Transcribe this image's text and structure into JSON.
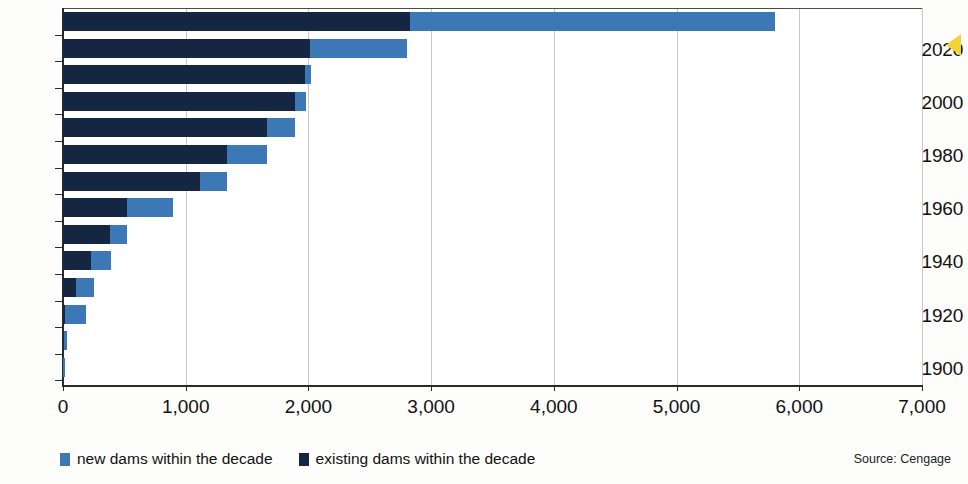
{
  "chart_data": {
    "type": "bar",
    "orientation": "horizontal",
    "stacked": true,
    "title": "",
    "xlabel": "",
    "ylabel": "",
    "xlim": [
      0,
      7000
    ],
    "xticks": [
      0,
      1000,
      2000,
      3000,
      4000,
      5000,
      6000,
      7000
    ],
    "xtick_labels": [
      "0",
      "1,000",
      "2,000",
      "3,000",
      "4,000",
      "5,000",
      "6,000",
      "7,000"
    ],
    "grid": true,
    "grid_axis": "x",
    "categories": [
      1900,
      1910,
      1920,
      1930,
      1940,
      1950,
      1960,
      1970,
      1980,
      1990,
      2000,
      2010,
      2020,
      2030
    ],
    "ytick_labels": [
      "1900",
      "1920",
      "1940",
      "1960",
      "1980",
      "2000",
      "2020"
    ],
    "ytick_values": [
      1900,
      1920,
      1940,
      1960,
      1980,
      2000,
      2020
    ],
    "legend_position": "bottom-left",
    "series": [
      {
        "name": "existing dams within the decade",
        "color": "#152642",
        "values": [
          0,
          10,
          20,
          110,
          230,
          380,
          520,
          1120,
          1340,
          1660,
          1890,
          1970,
          2010,
          2830
        ]
      },
      {
        "name": "new dams within the decade",
        "color": "#3b78b5",
        "values": [
          15,
          20,
          165,
          140,
          160,
          145,
          380,
          215,
          320,
          230,
          90,
          55,
          790,
          2970
        ]
      }
    ],
    "totals": [
      15,
      30,
      185,
      250,
      390,
      525,
      900,
      1335,
      1660,
      1890,
      1980,
      2025,
      2800,
      5800
    ],
    "annotations": [
      "Source: Cengage"
    ]
  },
  "legend": {
    "items": [
      {
        "label": "new dams within the decade",
        "swatch": "new"
      },
      {
        "label": "existing dams within the decade",
        "swatch": "existing"
      }
    ]
  },
  "source_note": "Source: Cengage",
  "colors": {
    "new_dams": "#3b78b5",
    "existing_dams": "#152642",
    "axis": "#2b2b2b",
    "grid": "#c9c9c9",
    "marker": "#f2d335"
  }
}
